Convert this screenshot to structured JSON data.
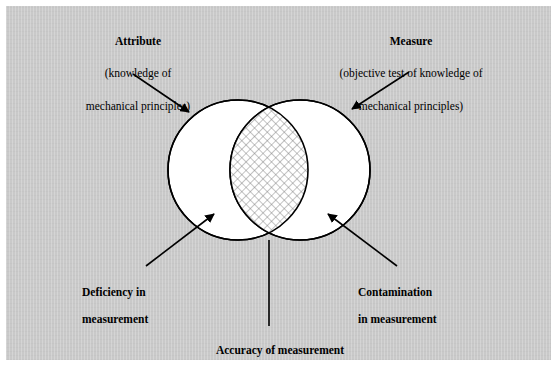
{
  "figure": {
    "background_color": "#c9c9c9",
    "page_color": "#ffffff",
    "ink_color": "#000000",
    "circle_fill": "#ffffff",
    "overlap_fill": "#ffffff",
    "hatch_color": "#6f6f6f"
  },
  "labels": {
    "attribute": {
      "title": "Attribute",
      "sub_line1": "(knowledge of",
      "sub_line2": "mechanical principles)"
    },
    "measure": {
      "title": "Measure",
      "sub_line1": "(objective test of knowledge of",
      "sub_line2": "mechanical principles)"
    },
    "deficiency": {
      "line1": "Deficiency in",
      "line2": "measurement"
    },
    "contamination": {
      "line1": "Contamination",
      "line2": "in measurement"
    },
    "accuracy": {
      "line1": "Accuracy of measurement"
    }
  },
  "diagram": {
    "type": "venn-two-set",
    "left_circle": {
      "name": "attribute-circle",
      "cx": 238,
      "cy": 170,
      "r": 70
    },
    "right_circle": {
      "name": "measure-circle",
      "cx": 300,
      "cy": 170,
      "r": 70
    },
    "intersection": {
      "name": "accuracy-region",
      "fill_pattern": "cross-hatch"
    },
    "pointers": [
      {
        "name": "attribute-pointer",
        "from": [
          133,
          74
        ],
        "to": [
          192,
          114
        ],
        "target": "left-circle"
      },
      {
        "name": "measure-pointer",
        "from": [
          409,
          72
        ],
        "to": [
          350,
          110
        ],
        "target": "right-circle"
      },
      {
        "name": "deficiency-pointer",
        "from": [
          146,
          266
        ],
        "to": [
          216,
          212
        ],
        "target": "left-only-region"
      },
      {
        "name": "contamination-pointer",
        "from": [
          397,
          266
        ],
        "to": [
          326,
          212
        ],
        "target": "right-only-region"
      },
      {
        "name": "accuracy-pointer",
        "from": [
          269,
          326
        ],
        "to": [
          269,
          240
        ],
        "target": "intersection-region"
      }
    ]
  }
}
